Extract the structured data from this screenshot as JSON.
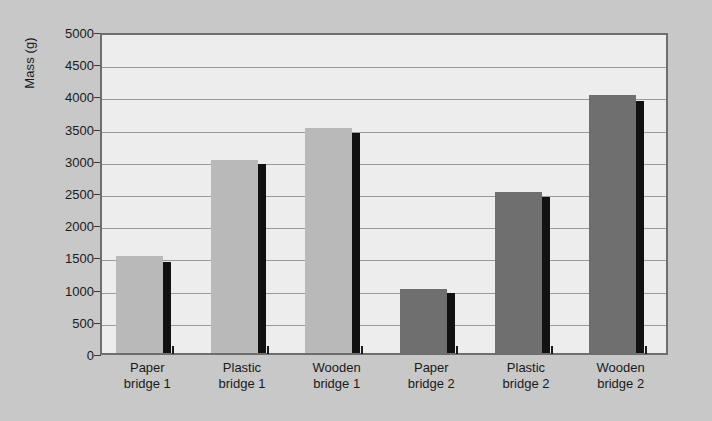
{
  "chart_data": {
    "type": "bar",
    "title": "",
    "xlabel": "",
    "ylabel": "Mass (g)",
    "ylim": [
      0,
      5000
    ],
    "ytick_step": 500,
    "yticks": [
      "5000",
      "4500",
      "4000",
      "3500",
      "3000",
      "2500",
      "2000",
      "1500",
      "1000",
      "500",
      "0"
    ],
    "grid": true,
    "legend": "none",
    "categories": [
      "Paper bridge 1",
      "Plastic bridge 1",
      "Wooden bridge 1",
      "Paper bridge 2",
      "Plastic bridge 2",
      "Wooden bridge 2"
    ],
    "category_lines": [
      [
        "Paper",
        "bridge 1"
      ],
      [
        "Plastic",
        "bridge 1"
      ],
      [
        "Wooden",
        "bridge 1"
      ],
      [
        "Paper",
        "bridge 2"
      ],
      [
        "Plastic",
        "bridge 2"
      ],
      [
        "Wooden",
        "bridge 2"
      ]
    ],
    "series": [
      {
        "name": "bar-primary",
        "values": [
          1500,
          3000,
          3500,
          1000,
          2500,
          4000
        ],
        "colors": [
          "#b9b9b9",
          "#b9b9b9",
          "#b9b9b9",
          "#6f6f6f",
          "#6f6f6f",
          "#6f6f6f"
        ]
      },
      {
        "name": "bar-marker",
        "values": [
          1420,
          2930,
          3420,
          930,
          2420,
          3920
        ],
        "color": "#111111"
      }
    ],
    "colors": {
      "background": "#c8c8c8",
      "plot_area": "#ededed",
      "frame": "#6e6e6e",
      "gridline": "#9a9a9a",
      "group1_bar": "#b9b9b9",
      "group2_bar": "#6f6f6f",
      "marker_bar": "#111111",
      "text": "#1a1a1a"
    }
  }
}
